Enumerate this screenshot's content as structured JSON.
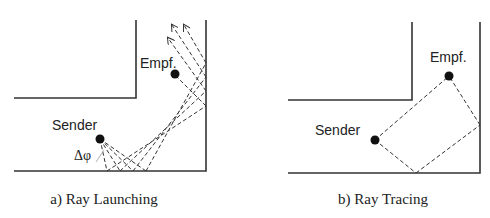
{
  "panels": [
    {
      "id": "a",
      "caption": "a) Ray Launching",
      "sender_label": "Sender",
      "receiver_label": "Empf.",
      "angle_label": "Δφ"
    },
    {
      "id": "b",
      "caption": "b) Ray Tracing",
      "sender_label": "Sender",
      "receiver_label": "Empf."
    }
  ],
  "colors": {
    "line": "#333333",
    "dot": "#111111",
    "background": "#ffffff"
  }
}
